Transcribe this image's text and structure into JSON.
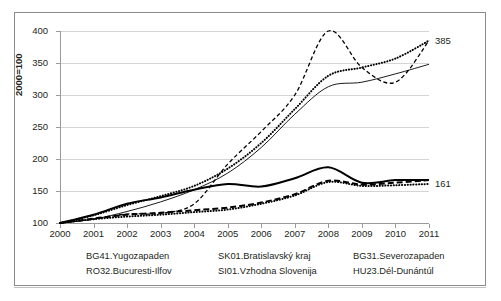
{
  "chart_data": {
    "type": "line",
    "title": "",
    "subtitle": "",
    "xlabel": "",
    "ylabel": "2000=100",
    "xlim": [
      2000,
      2011
    ],
    "ylim": [
      100,
      400
    ],
    "yticks": [
      100,
      150,
      200,
      250,
      300,
      350,
      400
    ],
    "grid": true,
    "legend_position": "bottom",
    "x": [
      2000,
      2001,
      2002,
      2003,
      2004,
      2005,
      2006,
      2007,
      2008,
      2009,
      2010,
      2011
    ],
    "categories": [
      "2000",
      "2001",
      "2002",
      "2003",
      "2004",
      "2005",
      "2006",
      "2007",
      "2008",
      "2009",
      "2010",
      "2011"
    ],
    "end_labels": [
      {
        "text": "385",
        "value": 385,
        "series": "BG41.Yugozapaden"
      },
      {
        "text": "161",
        "value": 161,
        "series": "BG31.Severozapaden"
      }
    ],
    "series": [
      {
        "name": "BG41.Yugozapaden",
        "style": "fine-dotted",
        "color": "#000000",
        "values": [
          100,
          112,
          128,
          142,
          158,
          185,
          225,
          278,
          330,
          343,
          357,
          385
        ]
      },
      {
        "name": "RO32.Bucuresti-Ilfov",
        "style": "dashed",
        "color": "#000000",
        "values": [
          100,
          106,
          114,
          115,
          130,
          192,
          243,
          300,
          400,
          343,
          320,
          385
        ]
      },
      {
        "name": "SK01.Bratislavský kraj",
        "style": "thin-solid",
        "color": "#000000",
        "values": [
          100,
          106,
          118,
          133,
          152,
          178,
          218,
          270,
          313,
          320,
          333,
          348
        ]
      },
      {
        "name": "SI01.Vzhodna Slovenija",
        "style": "long-dash",
        "color": "#000000",
        "values": [
          100,
          107,
          113,
          116,
          120,
          124,
          132,
          145,
          166,
          160,
          163,
          167
        ]
      },
      {
        "name": "BG31.Severozapaden",
        "style": "fine-dotted",
        "color": "#000000",
        "values": [
          100,
          106,
          110,
          113,
          117,
          121,
          130,
          143,
          164,
          158,
          159,
          161
        ]
      },
      {
        "name": "HU23.Dél-Dunántúl",
        "style": "thick-solid",
        "color": "#000000",
        "values": [
          100,
          113,
          130,
          140,
          152,
          161,
          157,
          170,
          187,
          163,
          167,
          167
        ]
      }
    ]
  },
  "axis": {
    "y_title": "2000=100",
    "y_ticks": [
      "400",
      "350",
      "300",
      "250",
      "200",
      "150",
      "100"
    ],
    "x_ticks": [
      "2000",
      "2001",
      "2002",
      "2003",
      "2004",
      "2005",
      "2006",
      "2007",
      "2008",
      "2009",
      "2010",
      "2011"
    ]
  },
  "legend": {
    "items": [
      {
        "label": "BG41.Yugozapaden",
        "style": "fine-dotted"
      },
      {
        "label": "RO32.Bucuresti-Ilfov",
        "style": "dashed"
      },
      {
        "label": "SK01.Bratislavský kraj",
        "style": "thin-solid"
      },
      {
        "label": "SI01.Vzhodna Slovenija",
        "style": "long-dash"
      },
      {
        "label": "BG31.Severozapaden",
        "style": "fine-dotted"
      },
      {
        "label": "HU23.Dél-Dunántúl",
        "style": "thick-solid"
      }
    ]
  }
}
